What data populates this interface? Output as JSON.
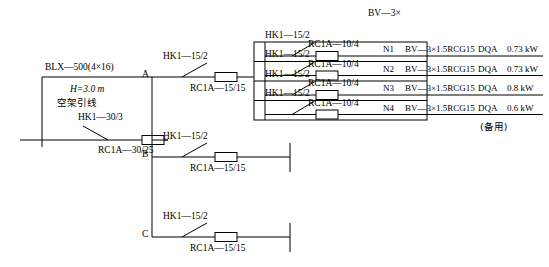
{
  "source": {
    "cable_label": "BLX—500(4×16)",
    "height_label": "H=3.0 m",
    "overhead_label": "空架引线",
    "main_switch": "HK1—30/3",
    "main_fuse": "RC1A—30/25"
  },
  "nodes": {
    "a": "A",
    "b": "B",
    "c": "C"
  },
  "branches": [
    {
      "node": "A",
      "switch": "HK1—15/2",
      "fuse": "RC1A—15/15"
    },
    {
      "node": "B",
      "switch": "HK1—15/2",
      "fuse": "RC1A—15/15"
    },
    {
      "node": "C",
      "switch": "HK1—15/2",
      "fuse": "RC1A—15/15"
    }
  ],
  "panel": {
    "header": "BV—3×",
    "spare_note": "(备用)",
    "circuits": [
      {
        "switch": "HK1—15/2",
        "fuse": "RC1A—10/4",
        "circuit_id": "N1",
        "wiring": "BV—3×1.5RCG15",
        "load_code": "DQA",
        "power": "0.73 kW"
      },
      {
        "switch": "HK1—15/2",
        "fuse": "RC1A—10/4",
        "circuit_id": "N2",
        "wiring": "BV—3×1.5RCG15",
        "load_code": "DQA",
        "power": "0.73 kW"
      },
      {
        "switch": "HK1—15/2",
        "fuse": "RC1A—10/4",
        "circuit_id": "N3",
        "wiring": "BV—3×1.5RCG15",
        "load_code": "DQA",
        "power": "0.8 kW"
      },
      {
        "switch": "HK1—15/2",
        "fuse": "RC1A—10/4",
        "circuit_id": "N4",
        "wiring": "BV—3×1.5RCG15",
        "load_code": "DQA",
        "power": "0.6 kW"
      }
    ]
  },
  "colors": {
    "line": "#000000",
    "fuse_fill": "#ffffff",
    "background": "#ffffff"
  }
}
